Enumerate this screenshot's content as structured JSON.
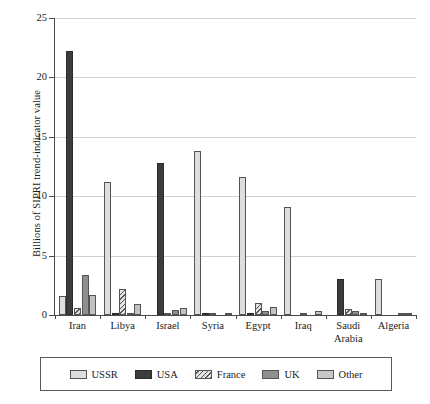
{
  "chart_data": {
    "type": "bar",
    "title": "",
    "subtitle": "",
    "xlabel": "",
    "ylabel": "Billions of SIPRI trend-indicator value",
    "ylim": [
      0,
      25
    ],
    "yticks": [
      0,
      5,
      10,
      15,
      20,
      25
    ],
    "ytick_labels": [
      "0",
      "5",
      "10",
      "15",
      "20",
      "25"
    ],
    "grid": "horizontal",
    "legend_position": "bottom",
    "categories": [
      "Iran",
      "Libya",
      "Israel",
      "Syria",
      "Egypt",
      "Iraq",
      "Saudi Arabia",
      "Algeria"
    ],
    "category_lines": [
      [
        "Iran"
      ],
      [
        "Libya"
      ],
      [
        "Israel"
      ],
      [
        "Syria"
      ],
      [
        "Egypt"
      ],
      [
        "Iraq"
      ],
      [
        "Saudi",
        "Arabia"
      ],
      [
        "Algeria"
      ]
    ],
    "series": [
      {
        "name": "USSR",
        "color": "#dedede",
        "values": [
          1.6,
          11.2,
          0.0,
          13.8,
          11.6,
          9.1,
          0.0,
          3.0
        ]
      },
      {
        "name": "USA",
        "color": "#3c3c3c",
        "values": [
          22.2,
          0.2,
          12.8,
          0.1,
          0.1,
          0.0,
          3.0,
          0.0
        ]
      },
      {
        "name": "France",
        "color": "#d8d8d8",
        "values": [
          0.6,
          2.2,
          0.05,
          0.15,
          1.0,
          0.2,
          0.5,
          0.0
        ]
      },
      {
        "name": "UK",
        "color": "#8f8f8f",
        "values": [
          3.4,
          0.2,
          0.4,
          0.0,
          0.3,
          0.0,
          0.3,
          0.05
        ]
      },
      {
        "name": "Other",
        "color": "#c2c2c2",
        "values": [
          1.7,
          0.9,
          0.6,
          0.1,
          0.7,
          0.3,
          0.15,
          0.15
        ]
      }
    ]
  },
  "legend": {
    "items": [
      {
        "label": "USSR",
        "swatch": "ussr"
      },
      {
        "label": "USA",
        "swatch": "usa"
      },
      {
        "label": "France",
        "swatch": "france"
      },
      {
        "label": "UK",
        "swatch": "uk"
      },
      {
        "label": "Other",
        "swatch": "other"
      }
    ]
  }
}
